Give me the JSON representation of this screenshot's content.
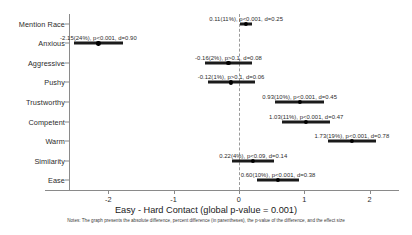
{
  "chart_data": {
    "type": "scatter",
    "title": "",
    "xlabel": "Easy - Hard Contact (global p-value = 0.001)",
    "ylabel": "",
    "xlim": [
      -2.6,
      2.45
    ],
    "xticks": [
      -2,
      -1,
      0,
      1,
      2
    ],
    "xticklabels": [
      "-2",
      "-1",
      "0",
      "1",
      "2"
    ],
    "grid": false,
    "legend": null,
    "zero_reference_line": 0,
    "categories": [
      "Mention Race",
      "Anxious",
      "Aggressive",
      "Pushy",
      "Trustworthy",
      "Competent",
      "Warm",
      "Similarity",
      "Ease"
    ],
    "points": [
      {
        "category": "Mention Race",
        "estimate": 0.11,
        "percent": "11%",
        "pvalue": "p<0.001",
        "effect_size": "d=0.25",
        "ci_low": 0.02,
        "ci_high": 0.2,
        "label": "0.11(11%), p<0.001, d=0.25"
      },
      {
        "category": "Anxious",
        "estimate": -2.15,
        "percent": "24%",
        "pvalue": "p<0.001",
        "effect_size": "d=0.90",
        "ci_low": -2.52,
        "ci_high": -1.78,
        "label": "-2.15(24%), p<0.001, d=0.90"
      },
      {
        "category": "Aggressive",
        "estimate": -0.16,
        "percent": "2%",
        "pvalue": "p>0.1",
        "effect_size": "d=0.08",
        "ci_low": -0.52,
        "ci_high": 0.2,
        "label": "-0.16(2%), p>0.1, d=0.08"
      },
      {
        "category": "Pushy",
        "estimate": -0.12,
        "percent": "1%",
        "pvalue": "p>0.1",
        "effect_size": "d=0.06",
        "ci_low": -0.48,
        "ci_high": 0.24,
        "label": "-0.12(1%), p>0.1, d=0.06"
      },
      {
        "category": "Trustworthy",
        "estimate": 0.93,
        "percent": "10%",
        "pvalue": "p<0.001",
        "effect_size": "d=0.45",
        "ci_low": 0.56,
        "ci_high": 1.3,
        "label": "0.93(10%), p<0.001, d=0.45"
      },
      {
        "category": "Competent",
        "estimate": 1.03,
        "percent": "11%",
        "pvalue": "p<0.001",
        "effect_size": "d=0.47",
        "ci_low": 0.66,
        "ci_high": 1.4,
        "label": "1.03(11%), p<0.001, d=0.47"
      },
      {
        "category": "Warm",
        "estimate": 1.73,
        "percent": "19%",
        "pvalue": "p<0.001",
        "effect_size": "d=0.78",
        "ci_low": 1.36,
        "ci_high": 2.1,
        "label": "1.73(19%), p<0.001, d=0.78"
      },
      {
        "category": "Similarity",
        "estimate": 0.22,
        "percent": "4%",
        "pvalue": "p<0.09",
        "effect_size": "d=0.14",
        "ci_low": -0.1,
        "ci_high": 0.54,
        "label": "0.22(4%), p<0.09, d=0.14"
      },
      {
        "category": "Ease",
        "estimate": 0.6,
        "percent": "10%",
        "pvalue": "p<0.001",
        "effect_size": "d=0.38",
        "ci_low": 0.28,
        "ci_high": 0.92,
        "label": "0.60(10%), p<0.001, d=0.38"
      }
    ],
    "footnote": "Notes: The graph presents the absolute difference, percent difference (in parentheses), the p-value of the difference, and the effect size",
    "colors": {
      "point": "#000000",
      "ci_bar": "#1b1b1b",
      "axis": "#8a8a8a",
      "zero_line": "#9a9a9a",
      "text": "#1a1a1a",
      "background": "#ffffff"
    }
  }
}
